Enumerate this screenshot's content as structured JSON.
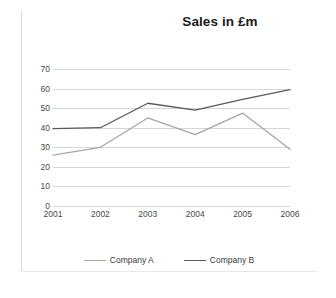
{
  "chart_data": {
    "type": "line",
    "title": "Sales in £m",
    "xlabel": "",
    "ylabel": "",
    "categories": [
      "2001",
      "2002",
      "2003",
      "2004",
      "2005",
      "2006"
    ],
    "x_tick_labels": [
      "2001",
      "2002",
      "2003",
      "2004",
      "2005",
      "2006"
    ],
    "y_tick_labels": [
      "70",
      "60",
      "50",
      "40",
      "30",
      "20",
      "10",
      "0"
    ],
    "y_ticks": [
      70,
      60,
      50,
      40,
      30,
      20,
      10,
      0
    ],
    "ylim": [
      0,
      70
    ],
    "grid": true,
    "grid_axis": "y",
    "legend_position": "bottom",
    "series": [
      {
        "name": "Company A",
        "color": "#a6a6a6",
        "values": [
          26,
          30,
          45,
          36.5,
          47.5,
          29
        ]
      },
      {
        "name": "Company B",
        "color": "#595959",
        "values": [
          39.5,
          40,
          52.5,
          49,
          54.5,
          59.5
        ]
      }
    ]
  },
  "legend": {
    "items": [
      {
        "label": "Company A",
        "color": "#a6a6a6"
      },
      {
        "label": "Company B",
        "color": "#595959"
      }
    ]
  },
  "colors": {
    "series_a": "#a6a6a6",
    "series_b": "#595959",
    "gridline": "#d6d6d6",
    "text": "#4a4a4a",
    "title": "#1a1a1a",
    "background": "#ffffff"
  }
}
